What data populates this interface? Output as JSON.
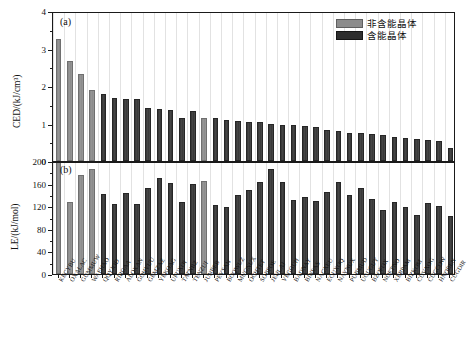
{
  "figure": {
    "panel_a_tag": "(a)",
    "panel_b_tag": "(b)"
  },
  "legend": {
    "position": "top-right-panel-a",
    "entries": [
      {
        "label": "非含能晶体",
        "color": "#8c8c8c",
        "key": "non-energetic"
      },
      {
        "label": "含能晶体",
        "color": "#2e2e2e",
        "key": "energetic"
      }
    ]
  },
  "chart_data": [
    {
      "type": "bar",
      "panel": "(a)",
      "title": "",
      "xlabel": "",
      "ylabel": "CED/(kJ/cm³)",
      "ylim": [
        0,
        4
      ],
      "yticks": [
        0,
        1,
        2,
        3,
        4
      ],
      "ytick_labels": [
        "0",
        "1",
        "2",
        "3",
        "4"
      ],
      "grid": "vertical",
      "categories": [
        "KECYBU",
        "OXALAC",
        "GUMMUW",
        "WAFHAO",
        "QQYJOD",
        "RIRGAA",
        "ALOXAN",
        "GOHVUU",
        "GEMZAZ",
        "YEKOAG",
        "UFUXOI",
        "TATNBZ",
        "TENZUI",
        "JUNBEB",
        "PEYSAN",
        "BOQWUZ",
        "MUGNUX",
        "OCHTET",
        "SOBFOE",
        "JEHLAJ",
        "VEGGUH",
        "BADNAY",
        "BINSAS",
        "NACXEU",
        "ECUXOQ",
        "NAYNUX",
        "PUBMUD",
        "UGUGUY",
        "BZOFOX",
        "NOETNO",
        "XERPAM",
        "BIZKOM",
        "CUVXOG",
        "CUGCOW",
        "HNOBEN",
        "CUGDIR"
      ],
      "values": [
        3.25,
        2.67,
        2.32,
        1.89,
        1.79,
        1.68,
        1.66,
        1.65,
        1.42,
        1.39,
        1.36,
        1.16,
        1.33,
        1.14,
        1.14,
        1.09,
        1.06,
        1.03,
        1.03,
        0.99,
        0.97,
        0.97,
        0.94,
        0.92,
        0.83,
        0.8,
        0.76,
        0.74,
        0.72,
        0.7,
        0.64,
        0.62,
        0.58,
        0.56,
        0.54,
        0.34
      ],
      "series_class": [
        "non-energetic",
        "non-energetic",
        "non-energetic",
        "non-energetic",
        "energetic",
        "energetic",
        "energetic",
        "energetic",
        "energetic",
        "energetic",
        "energetic",
        "energetic",
        "energetic",
        "non-energetic",
        "energetic",
        "energetic",
        "energetic",
        "energetic",
        "energetic",
        "energetic",
        "energetic",
        "energetic",
        "energetic",
        "energetic",
        "energetic",
        "energetic",
        "energetic",
        "energetic",
        "energetic",
        "energetic",
        "energetic",
        "energetic",
        "energetic",
        "energetic",
        "energetic",
        "energetic"
      ]
    },
    {
      "type": "bar",
      "panel": "(b)",
      "title": "",
      "xlabel": "",
      "ylabel": "LE/(kJ/mol)",
      "ylim": [
        0,
        200
      ],
      "yticks": [
        0,
        40,
        80,
        120,
        160,
        200
      ],
      "ytick_labels": [
        "0",
        "40",
        "80",
        "120",
        "160",
        "200"
      ],
      "grid": "vertical",
      "categories": [
        "KECYBU",
        "OXALAC",
        "GUMMUW",
        "WAFHAO",
        "QQYJOD",
        "RIRGAA",
        "ALOXAN",
        "GOHVUU",
        "GEMZAZ",
        "YEKOAG",
        "UFUXOI",
        "TATNBZ",
        "TENZUI",
        "JUNBEB",
        "PEYSAN",
        "BOQWUZ",
        "MUGNUX",
        "OCHTET",
        "SOBFOE",
        "JEHLAJ",
        "VEGGUH",
        "BADNAY",
        "BINSAS",
        "NACXEU",
        "ECUXOQ",
        "NAYNUX",
        "PUBMUD",
        "UGUGUY",
        "BZOFOX",
        "NOETNO",
        "XERPAM",
        "BIZKOM",
        "CUVXOG",
        "CUGCOW",
        "HNOBEN",
        "CUGDIR"
      ],
      "values": [
        198,
        128,
        176,
        185,
        142,
        124,
        144,
        124,
        152,
        170,
        161,
        127,
        160,
        165,
        122,
        119,
        140,
        148,
        162,
        185,
        163,
        131,
        136,
        130,
        146,
        163,
        140,
        152,
        133,
        114,
        128,
        118,
        104,
        126,
        120,
        102
      ],
      "series_class": [
        "non-energetic",
        "non-energetic",
        "non-energetic",
        "non-energetic",
        "energetic",
        "energetic",
        "energetic",
        "energetic",
        "energetic",
        "energetic",
        "energetic",
        "energetic",
        "energetic",
        "non-energetic",
        "energetic",
        "energetic",
        "energetic",
        "energetic",
        "energetic",
        "energetic",
        "energetic",
        "energetic",
        "energetic",
        "energetic",
        "energetic",
        "energetic",
        "energetic",
        "energetic",
        "energetic",
        "energetic",
        "energetic",
        "energetic",
        "energetic",
        "energetic",
        "energetic",
        "energetic"
      ]
    }
  ]
}
